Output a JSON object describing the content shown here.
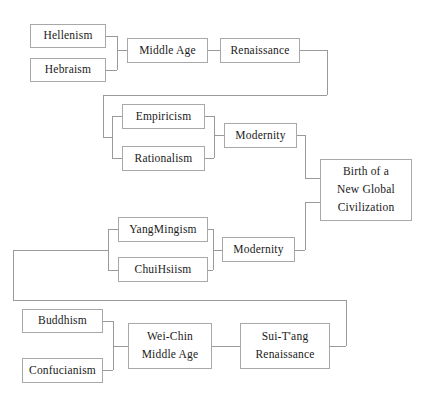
{
  "diagram": {
    "style": {
      "box_border_color": "#a8a8a8",
      "connector_color": "#9a9a9a",
      "background_color": "#ffffff",
      "text_color": "#1a1a1a"
    },
    "nodes": [
      {
        "id": "hellenism",
        "label": "Hellenism",
        "lines": [
          "Hellenism"
        ],
        "x": 30,
        "y": 24,
        "w": 76,
        "h": 24
      },
      {
        "id": "hebraism",
        "label": "Hebraism",
        "lines": [
          "Hebraism"
        ],
        "x": 30,
        "y": 58,
        "w": 76,
        "h": 24
      },
      {
        "id": "middle-age",
        "label": "Middle Age",
        "lines": [
          "Middle  Age"
        ],
        "x": 127,
        "y": 38,
        "w": 81,
        "h": 25
      },
      {
        "id": "renaissance",
        "label": "Renaissance",
        "lines": [
          "Renaissance"
        ],
        "x": 220,
        "y": 38,
        "w": 80,
        "h": 25
      },
      {
        "id": "empiricism",
        "label": "Empiricism",
        "lines": [
          "Empiricism"
        ],
        "x": 122,
        "y": 104,
        "w": 83,
        "h": 25
      },
      {
        "id": "rationalism",
        "label": "Rationalism",
        "lines": [
          "Rationalism"
        ],
        "x": 122,
        "y": 146,
        "w": 83,
        "h": 25
      },
      {
        "id": "modernity-west",
        "label": "Modernity",
        "lines": [
          "Modernity"
        ],
        "x": 224,
        "y": 123,
        "w": 73,
        "h": 25
      },
      {
        "id": "birth-global",
        "label": "Birth of a New Global Civilization",
        "lines": [
          "Birth  of  a",
          "New  Global",
          "Civilization"
        ],
        "x": 320,
        "y": 159,
        "w": 92,
        "h": 62
      },
      {
        "id": "yangmingism",
        "label": "YangMingism",
        "lines": [
          "YangMingism"
        ],
        "x": 118,
        "y": 217,
        "w": 90,
        "h": 25
      },
      {
        "id": "chuihsiism",
        "label": "ChuiHsiism",
        "lines": [
          "ChuiHsiism"
        ],
        "x": 118,
        "y": 257,
        "w": 90,
        "h": 25
      },
      {
        "id": "modernity-east",
        "label": "Modernity",
        "lines": [
          "Modernity"
        ],
        "x": 222,
        "y": 237,
        "w": 73,
        "h": 25
      },
      {
        "id": "buddhism",
        "label": "Buddhism",
        "lines": [
          "Buddhism"
        ],
        "x": 22,
        "y": 309,
        "w": 81,
        "h": 24
      },
      {
        "id": "confucianism",
        "label": "Confucianism",
        "lines": [
          "Confucianism"
        ],
        "x": 22,
        "y": 358,
        "w": 81,
        "h": 25
      },
      {
        "id": "wei-chin",
        "label": "Wei-Chin Middle Age",
        "lines": [
          "Wei-Chin",
          "Middle  Age"
        ],
        "x": 128,
        "y": 323,
        "w": 84,
        "h": 46
      },
      {
        "id": "sui-tang",
        "label": "Sui-T'ang Renaissance",
        "lines": [
          "Sui-T'ang",
          "Renaissance"
        ],
        "x": 240,
        "y": 323,
        "w": 90,
        "h": 46
      }
    ],
    "connectors": [
      {
        "from": "hellenism",
        "to": "bracket-west-ancient",
        "points": [
          [
            106,
            36
          ],
          [
            117,
            36
          ]
        ]
      },
      {
        "from": "hebraism",
        "to": "bracket-west-ancient",
        "points": [
          [
            106,
            70
          ],
          [
            117,
            70
          ]
        ]
      },
      {
        "from": "bracket-west-ancient",
        "to": "bracket-vertical",
        "points": [
          [
            117,
            36
          ],
          [
            117,
            70
          ]
        ]
      },
      {
        "from": "bracket-west-ancient",
        "to": "middle-age",
        "points": [
          [
            117,
            50
          ],
          [
            127,
            50
          ]
        ]
      },
      {
        "from": "middle-age",
        "to": "renaissance",
        "points": [
          [
            208,
            50
          ],
          [
            220,
            50
          ]
        ]
      },
      {
        "from": "renaissance",
        "to": "enlightenment-branch",
        "points": [
          [
            300,
            50
          ],
          [
            327,
            50
          ]
        ]
      },
      {
        "from": "enlightenment-branch",
        "to": "enlightenment-branch",
        "points": [
          [
            327,
            50
          ],
          [
            327,
            95
          ]
        ]
      },
      {
        "from": "enlightenment-branch",
        "to": "enlightenment-branch",
        "points": [
          [
            327,
            95
          ],
          [
            103,
            95
          ]
        ]
      },
      {
        "from": "enlightenment-branch",
        "to": "enlightenment-branch",
        "points": [
          [
            103,
            95
          ],
          [
            103,
            137
          ]
        ]
      },
      {
        "from": "enlightenment-branch",
        "to": "bracket-emp-rat",
        "points": [
          [
            103,
            137
          ],
          [
            112,
            137
          ]
        ]
      },
      {
        "from": "bracket-emp-rat",
        "to": "bracket-emp-rat",
        "points": [
          [
            112,
            116
          ],
          [
            112,
            158
          ]
        ]
      },
      {
        "from": "bracket-emp-rat",
        "to": "empiricism",
        "points": [
          [
            112,
            116
          ],
          [
            122,
            116
          ]
        ]
      },
      {
        "from": "bracket-emp-rat",
        "to": "rationalism",
        "points": [
          [
            112,
            158
          ],
          [
            122,
            158
          ]
        ]
      },
      {
        "from": "empiricism",
        "to": "merge-west-modern",
        "points": [
          [
            205,
            116
          ],
          [
            214,
            116
          ]
        ]
      },
      {
        "from": "rationalism",
        "to": "merge-west-modern",
        "points": [
          [
            205,
            158
          ],
          [
            214,
            158
          ]
        ]
      },
      {
        "from": "merge-west-modern",
        "to": "merge-west-modern",
        "points": [
          [
            214,
            116
          ],
          [
            214,
            158
          ]
        ]
      },
      {
        "from": "merge-west-modern",
        "to": "modernity-west",
        "points": [
          [
            214,
            135
          ],
          [
            224,
            135
          ]
        ]
      },
      {
        "from": "modernity-west",
        "to": "birth-global",
        "points": [
          [
            297,
            135
          ],
          [
            305,
            135
          ]
        ]
      },
      {
        "from": "modernity-west",
        "to": "birth-global",
        "points": [
          [
            305,
            135
          ],
          [
            305,
            178
          ]
        ]
      },
      {
        "from": "modernity-west",
        "to": "birth-global",
        "points": [
          [
            305,
            178
          ],
          [
            320,
            178
          ]
        ]
      },
      {
        "from": "modernity-east",
        "to": "birth-global",
        "points": [
          [
            295,
            250
          ],
          [
            305,
            250
          ]
        ]
      },
      {
        "from": "modernity-east",
        "to": "birth-global",
        "points": [
          [
            305,
            250
          ],
          [
            305,
            202
          ]
        ]
      },
      {
        "from": "modernity-east",
        "to": "birth-global",
        "points": [
          [
            305,
            202
          ],
          [
            320,
            202
          ]
        ]
      },
      {
        "from": "bracket-yang-chui",
        "to": "bracket-yang-chui",
        "points": [
          [
            108,
            229
          ],
          [
            108,
            270
          ]
        ]
      },
      {
        "from": "bracket-yang-chui",
        "to": "yangmingism",
        "points": [
          [
            108,
            229
          ],
          [
            118,
            229
          ]
        ]
      },
      {
        "from": "bracket-yang-chui",
        "to": "chuihsiism",
        "points": [
          [
            108,
            270
          ],
          [
            118,
            270
          ]
        ]
      },
      {
        "from": "sui-tang-branch",
        "to": "bracket-yang-chui",
        "points": [
          [
            99,
            250
          ],
          [
            108,
            250
          ]
        ]
      },
      {
        "from": "yangmingism",
        "to": "merge-east-modern",
        "points": [
          [
            208,
            229
          ],
          [
            213,
            229
          ]
        ]
      },
      {
        "from": "chuihsiism",
        "to": "merge-east-modern",
        "points": [
          [
            208,
            270
          ],
          [
            213,
            270
          ]
        ]
      },
      {
        "from": "merge-east-modern",
        "to": "merge-east-modern",
        "points": [
          [
            213,
            229
          ],
          [
            213,
            270
          ]
        ]
      },
      {
        "from": "merge-east-modern",
        "to": "modernity-east",
        "points": [
          [
            213,
            250
          ],
          [
            222,
            250
          ]
        ]
      },
      {
        "from": "sui-tang",
        "to": "sui-tang-branch",
        "points": [
          [
            330,
            346
          ],
          [
            346,
            346
          ]
        ]
      },
      {
        "from": "sui-tang-branch",
        "to": "sui-tang-branch",
        "points": [
          [
            346,
            346
          ],
          [
            346,
            300
          ]
        ]
      },
      {
        "from": "sui-tang-branch",
        "to": "sui-tang-branch",
        "points": [
          [
            346,
            300
          ],
          [
            13,
            300
          ]
        ]
      },
      {
        "from": "sui-tang-branch",
        "to": "sui-tang-branch",
        "points": [
          [
            13,
            300
          ],
          [
            13,
            250
          ]
        ]
      },
      {
        "from": "sui-tang-branch",
        "to": "sui-tang-branch",
        "points": [
          [
            13,
            250
          ],
          [
            99,
            250
          ]
        ]
      },
      {
        "from": "sui-tang-branch",
        "to": "sui-tang-branch",
        "points": [
          [
            99,
            250
          ],
          [
            99,
            250
          ]
        ]
      },
      {
        "from": "buddhism",
        "to": "bracket-east-ancient",
        "points": [
          [
            103,
            321
          ],
          [
            113,
            321
          ]
        ]
      },
      {
        "from": "confucianism",
        "to": "bracket-east-ancient",
        "points": [
          [
            103,
            370
          ],
          [
            113,
            370
          ]
        ]
      },
      {
        "from": "bracket-east-ancient",
        "to": "bracket-east-ancient",
        "points": [
          [
            113,
            321
          ],
          [
            113,
            370
          ]
        ]
      },
      {
        "from": "bracket-east-ancient",
        "to": "wei-chin",
        "points": [
          [
            113,
            346
          ],
          [
            128,
            346
          ]
        ]
      },
      {
        "from": "wei-chin",
        "to": "sui-tang",
        "points": [
          [
            212,
            346
          ],
          [
            240,
            346
          ]
        ]
      }
    ]
  }
}
